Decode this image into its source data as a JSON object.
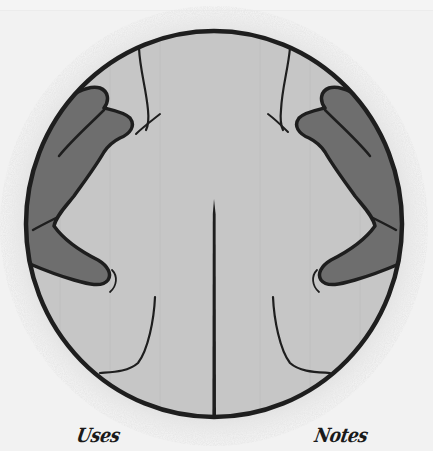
{
  "illustration": {
    "subject": "back-massage-hands-on-shoulders",
    "colors": {
      "page_background": "#f2f2f2",
      "halo": "#d4d4d4",
      "back_skin": "#c6c6c6",
      "hands": "#6e6e6e",
      "outline": "#1e1e1e"
    }
  },
  "captions": {
    "left": "Uses",
    "right": "Notes"
  }
}
